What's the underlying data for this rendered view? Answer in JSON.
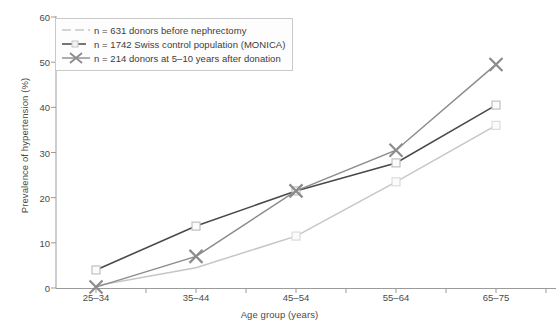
{
  "chart_data": {
    "type": "line",
    "title": "",
    "xlabel": "Age group (years)",
    "ylabel": "Prevalence of hypertension (%)",
    "categories": [
      "25–34",
      "35–44",
      "45–54",
      "55–64",
      "65–75"
    ],
    "ylim": [
      0,
      60
    ],
    "yticks": [
      0,
      10,
      20,
      30,
      40,
      50,
      60
    ],
    "grid": false,
    "legend_position": "top-left",
    "series": [
      {
        "name": "n = 631 donors before nephrectomy",
        "color": "#c6c6c6",
        "marker": "square-open",
        "linestyle": "solid",
        "values": [
          0.5,
          4.5,
          11.5,
          23.5,
          36.0
        ]
      },
      {
        "name": "n = 1742 Swiss control population (MONICA)",
        "color": "#4a4a4a",
        "marker": "square-open",
        "linestyle": "solid",
        "values": [
          4.0,
          13.7,
          21.5,
          27.7,
          40.5
        ]
      },
      {
        "name": "n = 214 donors at 5–10 years after donation",
        "color": "#8c8c8c",
        "marker": "x",
        "linestyle": "solid",
        "values": [
          0.2,
          7.0,
          21.5,
          30.5,
          49.5
        ]
      }
    ]
  },
  "axis": {
    "y_tick_labels": [
      "0",
      "10",
      "20",
      "30",
      "40",
      "50",
      "60"
    ],
    "x_tick_labels": [
      "25–34",
      "35–44",
      "45–54",
      "55–64",
      "65–75"
    ],
    "y_title": "Prevalence of hypertension (%)",
    "x_title": "Age group (years)"
  },
  "legend": {
    "items": [
      {
        "label": "n = 631 donors before nephrectomy",
        "key": "dashed-light-line-key"
      },
      {
        "label": "n = 1742 Swiss control population (MONICA)",
        "key": "dark-line-square-key"
      },
      {
        "label": "n = 214 donors at 5–10 years after donation",
        "key": "gray-line-x-key"
      }
    ]
  },
  "colors": {
    "series_light": "#c6c6c6",
    "series_dark": "#4a4a4a",
    "series_gray": "#8c8c8c",
    "axis": "#999999",
    "text": "#4a4a4a",
    "legend_border": "#c9c9c9",
    "background": "#ffffff"
  }
}
